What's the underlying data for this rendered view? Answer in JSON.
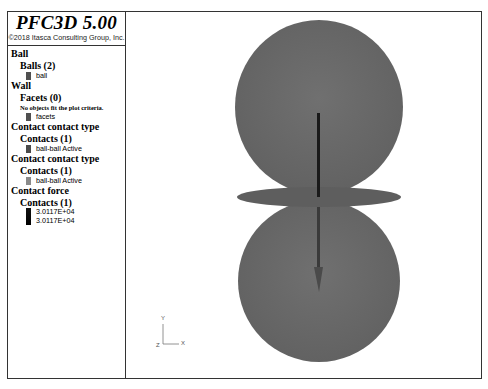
{
  "legend": {
    "title": "PFC3D 5.00",
    "copyright": "©2018 Itasca Consulting Group, Inc.",
    "sections": [
      {
        "heading": "Ball",
        "group": "Balls (2)",
        "items": [
          {
            "label": "ball",
            "color": "#505050"
          }
        ]
      },
      {
        "heading": "Wall",
        "group": "Facets (0)",
        "note": "No objects fit the plot criteria.",
        "items": [
          {
            "label": "facets",
            "color": "#505050"
          }
        ]
      },
      {
        "heading": "Contact contact type",
        "group": "Contacts (1)",
        "items": [
          {
            "label": "ball-ball Active",
            "color": "#4a4a4a"
          }
        ]
      },
      {
        "heading": "Contact contact type",
        "group": "Contacts (1)",
        "items": [
          {
            "label": "ball-ball Active",
            "color": "#8a8a8a"
          }
        ]
      },
      {
        "heading": "Contact force",
        "group": "Contacts (1)",
        "range": {
          "max": "3.0117E+04",
          "min": "3.0117E+04",
          "color": "#000000"
        }
      }
    ]
  },
  "view": {
    "sphere_color": "#6a6a6a",
    "disk_color": "#5e5e5e",
    "arrow_color": "#1a1a1a",
    "axes": {
      "x": "X",
      "y": "Y",
      "z": "Z"
    }
  }
}
